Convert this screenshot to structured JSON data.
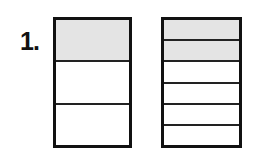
{
  "problem": {
    "label": "1.",
    "shade_color": "#e4e4e4",
    "line_color": "#111111",
    "figures": [
      {
        "id": "left",
        "parts": 3,
        "shaded_parts": 1,
        "fraction": "1/3",
        "segments": [
          true,
          false,
          false
        ]
      },
      {
        "id": "right",
        "parts": 6,
        "shaded_parts": 2,
        "fraction": "2/6",
        "segments": [
          true,
          true,
          false,
          false,
          false,
          false
        ]
      }
    ]
  }
}
